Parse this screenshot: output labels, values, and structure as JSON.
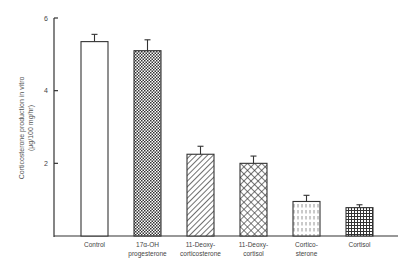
{
  "chart_data": {
    "type": "bar",
    "title": "",
    "xlabel": "",
    "ylabel": "Corticosterone production in vitro (μg/100 mg/hr)",
    "ylabel_lines": [
      "Corticosterone production in vitro",
      "(μg/100 mg/hr)"
    ],
    "ylim": [
      0,
      6
    ],
    "yticks": [
      "2",
      "4",
      "6"
    ],
    "grid": false,
    "legend": null,
    "categories": [
      [
        "Control"
      ],
      [
        "17α-OH",
        "progesterone"
      ],
      [
        "11-Deoxy-",
        "corticosterone"
      ],
      [
        "11-Deoxy-",
        "cortisol"
      ],
      [
        "Cortico-",
        "sterone"
      ],
      [
        "Cortisol"
      ]
    ],
    "values": [
      5.35,
      5.1,
      2.25,
      2.0,
      0.95,
      0.78
    ],
    "errors": [
      0.2,
      0.3,
      0.22,
      0.2,
      0.17,
      0.08
    ],
    "patterns": [
      "open",
      "fine-crosshatch",
      "diagonal-hatch",
      "diamond-crosshatch",
      "dashed-vertical",
      "grid"
    ]
  }
}
